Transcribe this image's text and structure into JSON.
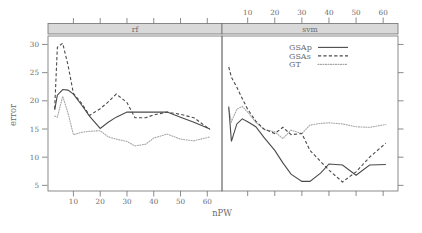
{
  "chart_data": {
    "type": "line",
    "title": "",
    "xlabel": "nPW",
    "ylabel": "error",
    "xlim": [
      2,
      64
    ],
    "ylim": [
      4,
      31.5
    ],
    "xticks": [
      10,
      20,
      30,
      40,
      50,
      60
    ],
    "yticks": [
      5,
      10,
      15,
      20,
      25,
      30
    ],
    "grid": false,
    "legend_position": "top-right (svm panel)",
    "panels": [
      {
        "name": "rf",
        "strip_label": "rf",
        "axis_position": "bottom",
        "series": [
          {
            "name": "GSAp",
            "style": "solid",
            "color": "#4a4a4a",
            "x": [
              3,
              4,
              6,
              8,
              10,
              13,
              16,
              20,
              23,
              26,
              30,
              33,
              37,
              40,
              45,
              50,
              55,
              61
            ],
            "values": [
              18.4,
              21.0,
              22.0,
              21.9,
              21.2,
              19.3,
              17.3,
              15.1,
              16.2,
              17.1,
              18.0,
              18.0,
              18.0,
              18.0,
              18.0,
              17.1,
              16.2,
              15.0
            ]
          },
          {
            "name": "GSAs",
            "style": "dashed",
            "color": "#4a4a4a",
            "x": [
              3,
              4,
              6,
              8,
              10,
              13,
              16,
              20,
              23,
              26,
              30,
              33,
              37,
              40,
              45,
              50,
              55,
              61
            ],
            "values": [
              18.6,
              29.5,
              30.2,
              26.3,
              21.3,
              19.6,
              17.4,
              18.6,
              19.8,
              21.2,
              19.7,
              17.0,
              17.0,
              17.5,
              18.0,
              17.6,
              17.0,
              14.9
            ]
          },
          {
            "name": "GT",
            "style": "dotted",
            "color": "#a6a6a6",
            "x": [
              3,
              4,
              6,
              8,
              10,
              13,
              16,
              20,
              23,
              26,
              30,
              33,
              37,
              40,
              45,
              50,
              55,
              61
            ],
            "values": [
              17.3,
              17.1,
              20.8,
              17.8,
              14.0,
              14.4,
              14.6,
              14.7,
              13.6,
              13.2,
              12.8,
              12.0,
              12.3,
              13.4,
              14.1,
              13.2,
              12.9,
              13.6
            ]
          }
        ]
      },
      {
        "name": "svm",
        "strip_label": "svm",
        "axis_position": "top",
        "series": [
          {
            "name": "GSAp",
            "style": "solid",
            "color": "#4a4a4a",
            "x": [
              3,
              4,
              6,
              8,
              10,
              13,
              16,
              20,
              23,
              26,
              30,
              33,
              37,
              40,
              45,
              50,
              55,
              61
            ],
            "values": [
              19.0,
              12.8,
              15.9,
              16.8,
              16.3,
              15.4,
              13.5,
              11.2,
              9.0,
              7.0,
              5.7,
              5.7,
              7.2,
              8.8,
              8.6,
              6.8,
              8.6,
              8.7
            ]
          },
          {
            "name": "GSAs",
            "style": "dashed",
            "color": "#4a4a4a",
            "x": [
              3,
              4,
              6,
              8,
              10,
              13,
              16,
              20,
              23,
              26,
              30,
              33,
              37,
              40,
              45,
              50,
              55,
              61
            ],
            "values": [
              26.0,
              24.2,
              22.4,
              20.4,
              18.5,
              16.4,
              15.0,
              14.2,
              15.3,
              14.0,
              14.2,
              11.2,
              9.2,
              7.7,
              5.6,
              7.4,
              10.0,
              12.5
            ]
          },
          {
            "name": "GT",
            "style": "dotted",
            "color": "#a6a6a6",
            "x": [
              3,
              4,
              6,
              8,
              10,
              13,
              16,
              20,
              23,
              26,
              30,
              33,
              37,
              40,
              45,
              50,
              55,
              61
            ],
            "values": [
              18.6,
              16.3,
              18.5,
              19.0,
              18.0,
              16.2,
              14.9,
              14.5,
              13.3,
              14.8,
              14.2,
              15.7,
              16.0,
              16.1,
              15.9,
              15.4,
              15.3,
              15.8
            ]
          }
        ]
      }
    ],
    "legend": [
      {
        "label": "GSAp",
        "style": "solid"
      },
      {
        "label": "GSAs",
        "style": "dashed"
      },
      {
        "label": "GT",
        "style": "dotted"
      }
    ]
  }
}
